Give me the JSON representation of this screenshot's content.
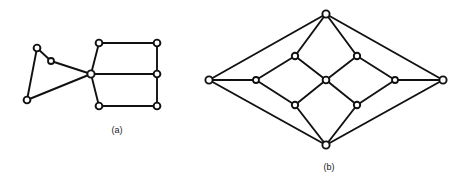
{
  "figure": {
    "background_color": "#ffffff",
    "stroke_color": "#111111",
    "node_fill_color": "#ffffff",
    "width": 467,
    "height": 185,
    "captions": {
      "a": "(a)",
      "b": "(b)"
    }
  },
  "graph_a": {
    "label": "(a)",
    "caption_position": {
      "x": 117,
      "y": 133
    },
    "node_radius": 3.4,
    "vertices": [
      {
        "id": "a1",
        "x": 37,
        "y": 48,
        "r": 3.4
      },
      {
        "id": "a2",
        "x": 51,
        "y": 61,
        "r": 3.0
      },
      {
        "id": "a3",
        "x": 27,
        "y": 100,
        "r": 3.4
      },
      {
        "id": "a4",
        "x": 91,
        "y": 74,
        "r": 3.6
      },
      {
        "id": "a5",
        "x": 99,
        "y": 43,
        "r": 3.4
      },
      {
        "id": "a6",
        "x": 157,
        "y": 43,
        "r": 3.4
      },
      {
        "id": "a7",
        "x": 157,
        "y": 74,
        "r": 3.4
      },
      {
        "id": "a8",
        "x": 157,
        "y": 106,
        "r": 3.4
      },
      {
        "id": "a9",
        "x": 99,
        "y": 106,
        "r": 3.4
      }
    ],
    "edges": [
      {
        "from": "a1",
        "to": "a2"
      },
      {
        "from": "a1",
        "to": "a3"
      },
      {
        "from": "a2",
        "to": "a4"
      },
      {
        "from": "a3",
        "to": "a4"
      },
      {
        "from": "a4",
        "to": "a5"
      },
      {
        "from": "a4",
        "to": "a7"
      },
      {
        "from": "a4",
        "to": "a9"
      },
      {
        "from": "a5",
        "to": "a6"
      },
      {
        "from": "a6",
        "to": "a7"
      },
      {
        "from": "a7",
        "to": "a8"
      },
      {
        "from": "a8",
        "to": "a9"
      }
    ]
  },
  "graph_b": {
    "label": "(b)",
    "caption_position": {
      "x": 329,
      "y": 170
    },
    "node_radius": 3.4,
    "vertices": [
      {
        "id": "b_top",
        "x": 326,
        "y": 14,
        "r": 3.6
      },
      {
        "id": "b_left",
        "x": 209,
        "y": 80,
        "r": 3.6
      },
      {
        "id": "b_right",
        "x": 443,
        "y": 80,
        "r": 3.6
      },
      {
        "id": "b_bottom",
        "x": 326,
        "y": 145,
        "r": 3.6
      },
      {
        "id": "b_nw",
        "x": 295,
        "y": 56,
        "r": 3.2
      },
      {
        "id": "b_ne",
        "x": 357,
        "y": 56,
        "r": 3.2
      },
      {
        "id": "b_w",
        "x": 256,
        "y": 80,
        "r": 3.0
      },
      {
        "id": "b_c",
        "x": 326,
        "y": 80,
        "r": 3.4
      },
      {
        "id": "b_e",
        "x": 395,
        "y": 80,
        "r": 3.0
      },
      {
        "id": "b_sw",
        "x": 295,
        "y": 105,
        "r": 3.2
      },
      {
        "id": "b_se",
        "x": 357,
        "y": 105,
        "r": 3.2
      }
    ],
    "edges": [
      {
        "from": "b_top",
        "to": "b_left"
      },
      {
        "from": "b_top",
        "to": "b_right"
      },
      {
        "from": "b_bottom",
        "to": "b_left"
      },
      {
        "from": "b_bottom",
        "to": "b_right"
      },
      {
        "from": "b_top",
        "to": "b_nw"
      },
      {
        "from": "b_top",
        "to": "b_ne"
      },
      {
        "from": "b_bottom",
        "to": "b_sw"
      },
      {
        "from": "b_bottom",
        "to": "b_se"
      },
      {
        "from": "b_left",
        "to": "b_w"
      },
      {
        "from": "b_right",
        "to": "b_e"
      },
      {
        "from": "b_nw",
        "to": "b_w"
      },
      {
        "from": "b_nw",
        "to": "b_c"
      },
      {
        "from": "b_ne",
        "to": "b_c"
      },
      {
        "from": "b_ne",
        "to": "b_e"
      },
      {
        "from": "b_sw",
        "to": "b_w"
      },
      {
        "from": "b_sw",
        "to": "b_c"
      },
      {
        "from": "b_se",
        "to": "b_c"
      },
      {
        "from": "b_se",
        "to": "b_e"
      }
    ]
  }
}
